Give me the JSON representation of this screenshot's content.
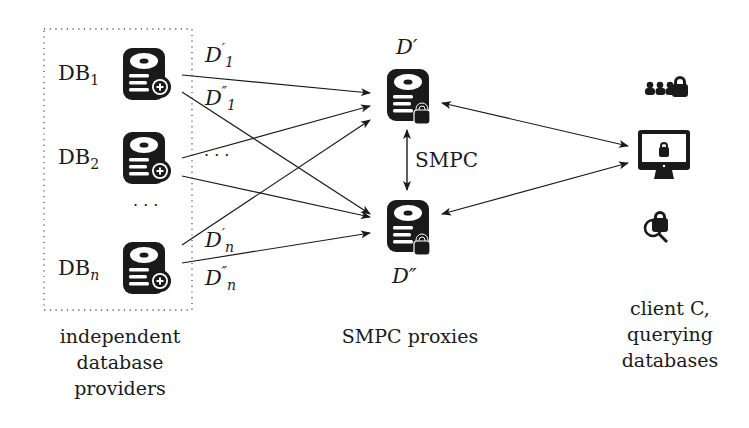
{
  "providers": {
    "caption": [
      "independent",
      "database",
      "providers"
    ],
    "items": [
      {
        "label": "DB",
        "sub": "1",
        "share1": "D",
        "share1_sub": "1",
        "share1_sup": "′",
        "share2": "D",
        "share2_sub": "1",
        "share2_sup": "″"
      },
      {
        "label": "DB",
        "sub": "2",
        "share_ellipsis": "· · ·"
      },
      {
        "label": "DB",
        "sub": "n",
        "share1": "D",
        "share1_sub": "n",
        "share1_sup": "′",
        "share2": "D",
        "share2_sub": "n",
        "share2_sup": "″"
      }
    ],
    "ellipsis": "· · ·"
  },
  "proxies": {
    "caption": "SMPC proxies",
    "top_label": "D′",
    "bottom_label": "D″",
    "link_label": "SMPC"
  },
  "client": {
    "caption": [
      "client C,",
      "querying",
      "databases"
    ],
    "icons": [
      "users-lock-icon",
      "monitor-lock-icon",
      "search-lock-icon"
    ]
  },
  "colors": {
    "ink": "#1a1a1a",
    "box": "#555555"
  }
}
